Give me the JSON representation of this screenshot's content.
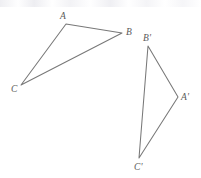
{
  "figure": {
    "background_color": "#ffffff",
    "stroke_color": "#787878",
    "label_color": "#5a5a5a",
    "canvas": {
      "width": 201,
      "height": 178
    },
    "shapes": [
      {
        "name": "triangle-abc",
        "kind": "triangle",
        "closed": true,
        "points": "66,24 122,33 21,85",
        "vertices": [
          {
            "id": "A",
            "label": "A",
            "x": 66,
            "y": 24,
            "label_x": 60,
            "label_y": 11
          },
          {
            "id": "B",
            "label": "B",
            "x": 122,
            "y": 33,
            "label_x": 126,
            "label_y": 27
          },
          {
            "id": "C",
            "label": "C",
            "x": 21,
            "y": 85,
            "label_x": 11,
            "label_y": 84
          }
        ]
      },
      {
        "name": "triangle-a-prime-b-prime-c-prime",
        "kind": "triangle",
        "closed": true,
        "points": "148,46 178,97 139,158",
        "vertices": [
          {
            "id": "Bp",
            "label": "B'",
            "x": 148,
            "y": 46,
            "label_x": 143,
            "label_y": 33
          },
          {
            "id": "Ap",
            "label": "A'",
            "x": 178,
            "y": 97,
            "label_x": 181,
            "label_y": 92
          },
          {
            "id": "Cp",
            "label": "C'",
            "x": 139,
            "y": 158,
            "label_x": 134,
            "label_y": 162
          }
        ]
      }
    ]
  }
}
